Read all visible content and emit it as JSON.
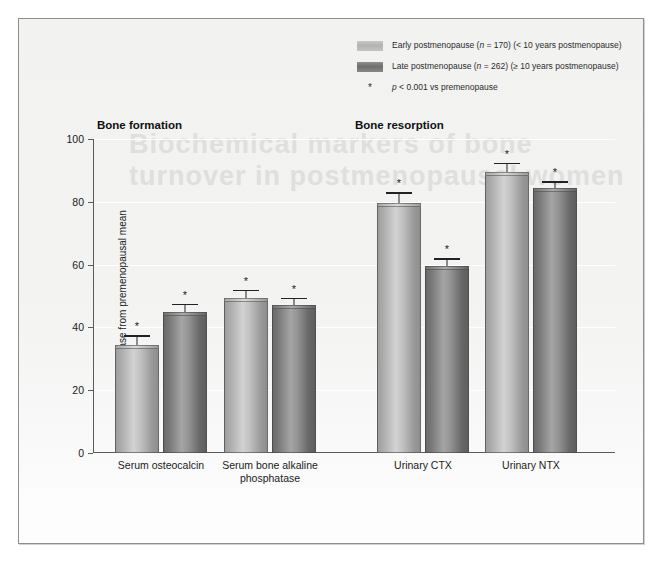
{
  "figure": {
    "ghost_text_line1": "Biochemical markers of bone",
    "ghost_text_line2": "turnover in postmenopausal women"
  },
  "legend": {
    "entries": [
      {
        "label_pre": "Early postmenopause (",
        "italic": "n",
        "label_mid": " = 170) (< 10 years postmenopause)",
        "swatch": "early",
        "color": "#bdbdbd"
      },
      {
        "label_pre": "Late postmenopause (",
        "italic": "n",
        "label_mid": " = 262) (≥ 10 years postmenopause)",
        "swatch": "late",
        "color": "#787878"
      }
    ],
    "footnote_mark": "*",
    "footnote_pre": "",
    "footnote_italic": "p",
    "footnote_text": " < 0.001 vs premenopause"
  },
  "sections": {
    "formation": "Bone formation",
    "resorption": "Bone resorption"
  },
  "chart_data": {
    "type": "bar",
    "title": "",
    "xlabel": "",
    "ylabel": "% increase from premenopausal mean",
    "ylim": [
      0,
      100
    ],
    "yticks": [
      0,
      20,
      40,
      60,
      80,
      100
    ],
    "ytick_labels": [
      "0",
      "20",
      "40",
      "60",
      "80",
      "100"
    ],
    "grid": true,
    "legend_position": "top-right",
    "categories": [
      "Serum osteocalcin",
      "Serum bone alkaline phosphatase",
      "Urinary CTX",
      "Urinary NTX"
    ],
    "category_lines": [
      [
        "Serum osteocalcin"
      ],
      [
        "Serum bone alkaline",
        "phosphatase"
      ],
      [
        "Urinary CTX"
      ],
      [
        "Urinary NTX"
      ]
    ],
    "series": [
      {
        "name": "Early postmenopause (n = 170) (< 10 years postmenopause)",
        "color": "#bdbdbd",
        "values": [
          34.5,
          49.5,
          79.5,
          89.5
        ],
        "errors": [
          3.0,
          2.5,
          3.5,
          3.0
        ],
        "significance": [
          "*",
          "*",
          "*",
          "*"
        ]
      },
      {
        "name": "Late postmenopause (n = 262) (≥ 10 years postmenopause)",
        "color": "#787878",
        "values": [
          45.0,
          47.0,
          59.5,
          84.5
        ],
        "errors": [
          2.5,
          2.5,
          2.5,
          2.0
        ],
        "significance": [
          "*",
          "*",
          "*",
          "*"
        ]
      }
    ]
  }
}
